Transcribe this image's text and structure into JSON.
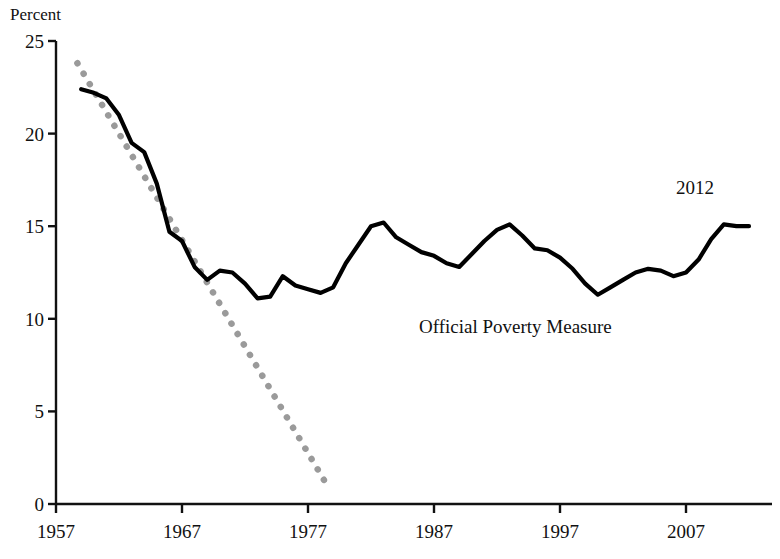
{
  "figure": {
    "axis_title_y": "Percent",
    "series_label": "Official Poverty Measure",
    "year_callout": "2012"
  },
  "chart_data": {
    "type": "line",
    "title": "",
    "subtitle": "",
    "xlabel": "",
    "ylabel": "Percent",
    "xlim": [
      1957,
      2013
    ],
    "ylim": [
      0,
      25
    ],
    "grid": false,
    "legend": "none",
    "annotations": [
      {
        "text": "Official Poverty Measure",
        "x": 1986,
        "y": 9.9
      },
      {
        "text": "2012",
        "x": 2006.5,
        "y": 17.0
      }
    ],
    "xticks": [
      1957,
      1967,
      1977,
      1987,
      1997,
      2007
    ],
    "xtick_labels": [
      "1957",
      "1967",
      "1977",
      "1987",
      "1997",
      "2007"
    ],
    "yticks": [
      0,
      5,
      10,
      15,
      20,
      25
    ],
    "ytick_labels": [
      "0",
      "5",
      "10",
      "15",
      "20",
      "25"
    ],
    "series": [
      {
        "name": "Official Poverty Measure",
        "style": "solid",
        "color": "#000000",
        "x": [
          1959,
          1960,
          1961,
          1962,
          1963,
          1964,
          1965,
          1966,
          1967,
          1968,
          1969,
          1970,
          1971,
          1972,
          1973,
          1974,
          1975,
          1976,
          1977,
          1978,
          1979,
          1980,
          1981,
          1982,
          1983,
          1984,
          1985,
          1986,
          1987,
          1988,
          1989,
          1990,
          1991,
          1992,
          1993,
          1994,
          1995,
          1996,
          1997,
          1998,
          1999,
          2000,
          2001,
          2002,
          2003,
          2004,
          2005,
          2006,
          2007,
          2008,
          2009,
          2010,
          2011,
          2012
        ],
        "y": [
          22.4,
          22.2,
          21.9,
          21.0,
          19.5,
          19.0,
          17.3,
          14.7,
          14.2,
          12.8,
          12.1,
          12.6,
          12.5,
          11.9,
          11.1,
          11.2,
          12.3,
          11.8,
          11.6,
          11.4,
          11.7,
          13.0,
          14.0,
          15.0,
          15.2,
          14.4,
          14.0,
          13.6,
          13.4,
          13.0,
          12.8,
          13.5,
          14.2,
          14.8,
          15.1,
          14.5,
          13.8,
          13.7,
          13.3,
          12.7,
          11.9,
          11.3,
          11.7,
          12.1,
          12.5,
          12.7,
          12.6,
          12.3,
          12.5,
          13.2,
          14.3,
          15.1,
          15.0,
          15.0
        ]
      },
      {
        "name": "Trend (dotted)",
        "style": "dotted",
        "color": "#9a9a9a",
        "x": [
          1958.7,
          1959.7,
          1960.7,
          1961.7,
          1962.7,
          1963.7,
          1964.7,
          1965.7,
          1966.7,
          1967.7,
          1968.7,
          1969.7,
          1970.7,
          1971.7,
          1972.7,
          1973.7,
          1974.7,
          1975.7,
          1976.7,
          1977.7,
          1978.7
        ],
        "y": [
          23.8,
          22.65,
          21.5,
          20.35,
          19.2,
          18.05,
          16.9,
          15.75,
          14.6,
          13.45,
          12.3,
          11.15,
          10.0,
          8.85,
          7.7,
          6.55,
          5.4,
          4.25,
          3.1,
          1.95,
          0.8
        ]
      }
    ]
  },
  "colors": {
    "line": "#000000",
    "dotted": "#9a9a9a",
    "axis": "#111111",
    "background": "#ffffff"
  }
}
